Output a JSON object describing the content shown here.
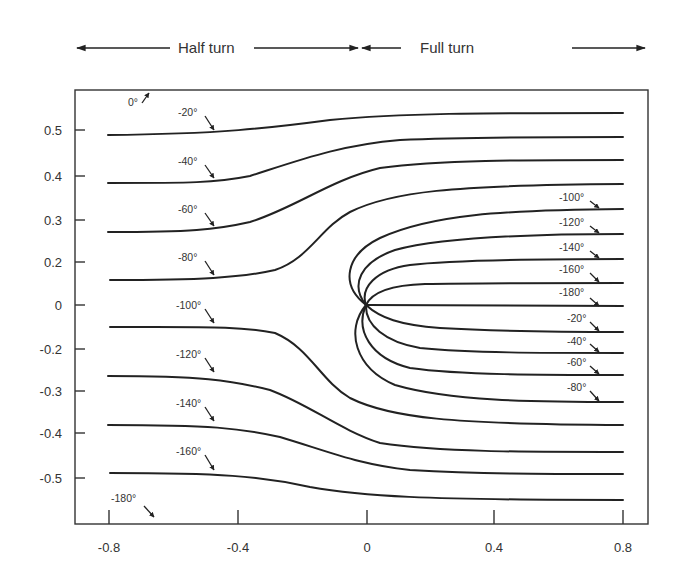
{
  "chart_data": {
    "type": "line",
    "title": "",
    "xlabel": "",
    "ylabel": "",
    "xlim": [
      -0.85,
      0.88
    ],
    "x_ticks": [
      "-0.8",
      "-0.4",
      "0",
      "0.4",
      "0.8"
    ],
    "y_ticks": [
      "0.5",
      "0.4",
      "0.3",
      "0.2",
      "0",
      "-0.2",
      "-0.3",
      "-0.4",
      "-0.5"
    ],
    "grid": false,
    "legend": "none",
    "header_regions": [
      {
        "label": "Half turn",
        "x_range": [
          -0.85,
          0
        ]
      },
      {
        "label": "Full turn",
        "x_range": [
          0,
          0.88
        ]
      }
    ],
    "series": [
      {
        "name": "-20° (half turn)",
        "region": "half",
        "x": [
          -0.8,
          -0.4,
          0,
          0.4,
          0.8
        ],
        "y": [
          0.49,
          0.49,
          0.51,
          0.53,
          0.54
        ]
      },
      {
        "name": "-40° (half turn)",
        "region": "half",
        "x": [
          -0.8,
          -0.4,
          0,
          0.4,
          0.8
        ],
        "y": [
          0.38,
          0.38,
          0.44,
          0.48,
          0.48
        ]
      },
      {
        "name": "-60° (half turn)",
        "region": "half",
        "x": [
          -0.8,
          -0.4,
          0,
          0.4,
          0.8
        ],
        "y": [
          0.27,
          0.28,
          0.37,
          0.42,
          0.43
        ]
      },
      {
        "name": "-80° (half turn)",
        "region": "half",
        "x": [
          -0.8,
          -0.4,
          -0.1,
          0.4,
          0.8
        ],
        "y": [
          0.16,
          0.16,
          0.2,
          0.37,
          0.38
        ]
      },
      {
        "name": "-100° (half turn)",
        "region": "half",
        "x": [
          -0.8,
          -0.4,
          -0.1,
          0.4,
          0.8
        ],
        "y": [
          -0.05,
          -0.05,
          -0.1,
          -0.28,
          -0.28
        ]
      },
      {
        "name": "-120° (half turn)",
        "region": "half",
        "x": [
          -0.8,
          -0.4,
          0,
          0.4,
          0.8
        ],
        "y": [
          -0.27,
          -0.27,
          -0.33,
          -0.36,
          -0.37
        ]
      },
      {
        "name": "-140° (half turn)",
        "region": "half",
        "x": [
          -0.8,
          -0.4,
          0,
          0.4,
          0.8
        ],
        "y": [
          -0.38,
          -0.38,
          -0.42,
          -0.44,
          -0.44
        ]
      },
      {
        "name": "-160° (half turn)",
        "region": "half",
        "x": [
          -0.8,
          -0.4,
          0,
          0.4,
          0.8
        ],
        "y": [
          -0.49,
          -0.49,
          -0.52,
          -0.54,
          -0.55
        ]
      },
      {
        "name": "-100° (full turn)",
        "region": "full",
        "x": [
          0,
          0.4,
          0.8
        ],
        "y": [
          0,
          0.31,
          0.33
        ]
      },
      {
        "name": "-120° (full turn)",
        "region": "full",
        "x": [
          0,
          0.4,
          0.8
        ],
        "y": [
          0,
          0.25,
          0.27
        ]
      },
      {
        "name": "-140° (full turn)",
        "region": "full",
        "x": [
          0,
          0.4,
          0.8
        ],
        "y": [
          0,
          0.19,
          0.21
        ]
      },
      {
        "name": "-160° (full turn)",
        "region": "full",
        "x": [
          0,
          0.4,
          0.8
        ],
        "y": [
          0,
          0.13,
          0.15
        ]
      },
      {
        "name": "-180° (full turn)",
        "region": "full",
        "x": [
          0,
          0.4,
          0.8
        ],
        "y": [
          0,
          0.0,
          0.0
        ]
      },
      {
        "name": "-20° (full turn)",
        "region": "full",
        "x": [
          0,
          0.4,
          0.8
        ],
        "y": [
          0,
          -0.05,
          -0.06
        ]
      },
      {
        "name": "-40° (full turn)",
        "region": "full",
        "x": [
          0,
          0.4,
          0.8
        ],
        "y": [
          0,
          -0.1,
          -0.11
        ]
      },
      {
        "name": "-60° (full turn)",
        "region": "full",
        "x": [
          0,
          0.4,
          0.8
        ],
        "y": [
          0,
          -0.15,
          -0.16
        ]
      },
      {
        "name": "-80° (full turn)",
        "region": "full",
        "x": [
          0,
          0.4,
          0.8
        ],
        "y": [
          0,
          -0.21,
          -0.23
        ]
      }
    ],
    "annotations": [
      "0°",
      "-20°",
      "-40°",
      "-60°",
      "-80°",
      "-100°",
      "-120°",
      "-140°",
      "-160°",
      "-180°",
      "-100°",
      "-120°",
      "-140°",
      "-160°",
      "-180°",
      "-20°",
      "-40°",
      "-60°",
      "-80°"
    ]
  },
  "header": {
    "half_turn": "Half turn",
    "full_turn": "Full turn"
  },
  "axes": {
    "x_ticks": [
      {
        "label": "-0.8",
        "px": 109
      },
      {
        "label": "-0.4",
        "px": 238
      },
      {
        "label": "0",
        "px": 367
      },
      {
        "label": "0.4",
        "px": 494
      },
      {
        "label": "0.8",
        "px": 623
      }
    ],
    "y_ticks": [
      {
        "label": "0.5",
        "px": 130
      },
      {
        "label": "0.4",
        "px": 176
      },
      {
        "label": "0.3",
        "px": 220
      },
      {
        "label": "0.2",
        "px": 262
      },
      {
        "label": "0",
        "px": 305
      },
      {
        "label": "-0.2",
        "px": 349
      },
      {
        "label": "-0.3",
        "px": 391
      },
      {
        "label": "-0.4",
        "px": 433
      },
      {
        "label": "-0.5",
        "px": 478
      }
    ]
  },
  "labels": {
    "left": [
      {
        "text": "0°",
        "x": 128,
        "y": 106,
        "ax1": 142,
        "ay1": 103,
        "ax2": 149,
        "ay2": 93
      },
      {
        "text": "-20°",
        "x": 178,
        "y": 116,
        "ax1": 205,
        "ay1": 116,
        "ax2": 214,
        "ay2": 130
      },
      {
        "text": "-40°",
        "x": 178,
        "y": 165,
        "ax1": 205,
        "ay1": 165,
        "ax2": 214,
        "ay2": 178
      },
      {
        "text": "-60°",
        "x": 178,
        "y": 213,
        "ax1": 205,
        "ay1": 213,
        "ax2": 214,
        "ay2": 226
      },
      {
        "text": "-80°",
        "x": 178,
        "y": 261,
        "ax1": 205,
        "ay1": 261,
        "ax2": 214,
        "ay2": 275
      },
      {
        "text": "-100°",
        "x": 176,
        "y": 309,
        "ax1": 205,
        "ay1": 309,
        "ax2": 214,
        "ay2": 323
      },
      {
        "text": "-120°",
        "x": 176,
        "y": 358,
        "ax1": 205,
        "ay1": 358,
        "ax2": 214,
        "ay2": 372
      },
      {
        "text": "-140°",
        "x": 176,
        "y": 407,
        "ax1": 205,
        "ay1": 407,
        "ax2": 214,
        "ay2": 421
      },
      {
        "text": "-160°",
        "x": 176,
        "y": 455,
        "ax1": 205,
        "ay1": 455,
        "ax2": 214,
        "ay2": 470
      },
      {
        "text": "-180°",
        "x": 111,
        "y": 502,
        "ax1": 144,
        "ay1": 506,
        "ax2": 154,
        "ay2": 517
      }
    ],
    "right": [
      {
        "text": "-100°",
        "x": 559,
        "y": 201,
        "ax1": 590,
        "ay1": 201,
        "ax2": 599,
        "ay2": 208
      },
      {
        "text": "-120°",
        "x": 559,
        "y": 226,
        "ax1": 590,
        "ay1": 226,
        "ax2": 599,
        "ay2": 233
      },
      {
        "text": "-140°",
        "x": 559,
        "y": 251,
        "ax1": 590,
        "ay1": 251,
        "ax2": 599,
        "ay2": 258
      },
      {
        "text": "-160°",
        "x": 559,
        "y": 273,
        "ax1": 590,
        "ay1": 273,
        "ax2": 599,
        "ay2": 282
      },
      {
        "text": "-180°",
        "x": 559,
        "y": 296,
        "ax1": 590,
        "ay1": 298,
        "ax2": 599,
        "ay2": 306
      },
      {
        "text": "-20°",
        "x": 567,
        "y": 322,
        "ax1": 590,
        "ay1": 322,
        "ax2": 599,
        "ay2": 331
      },
      {
        "text": "-40°",
        "x": 567,
        "y": 345,
        "ax1": 590,
        "ay1": 344,
        "ax2": 599,
        "ay2": 352
      },
      {
        "text": "-60°",
        "x": 567,
        "y": 366,
        "ax1": 590,
        "ay1": 366,
        "ax2": 599,
        "ay2": 374
      },
      {
        "text": "-80°",
        "x": 567,
        "y": 391,
        "ax1": 590,
        "ay1": 391,
        "ax2": 599,
        "ay2": 401
      }
    ]
  }
}
